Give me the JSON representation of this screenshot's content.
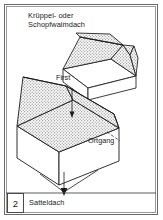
{
  "figure": {
    "number": "2",
    "caption": "Satteldach",
    "title": "Krüppel- oder\nSchopfwalmdach",
    "labels": {
      "ridge": "First",
      "verge": "Ortgang"
    },
    "colors": {
      "line": "#1a1a1a",
      "frame_outer": "#6b6b6b",
      "frame_inner": "#9a9a9a",
      "roof_fill": "#c9c9c9",
      "wall_fill": "#ffffff",
      "background": "#ffffff"
    },
    "diagrams": [
      {
        "name": "half-hipped-roof",
        "type": "Krüppelwalmdach",
        "position": "top-right"
      },
      {
        "name": "gable-roof",
        "type": "Satteldach",
        "position": "center",
        "annotations": [
          "First",
          "Ortgang"
        ]
      }
    ]
  }
}
